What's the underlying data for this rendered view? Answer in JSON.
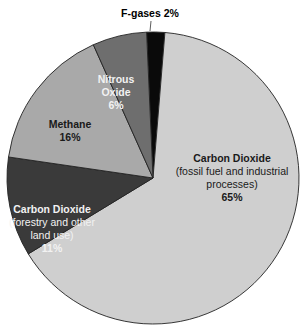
{
  "chart_data": {
    "type": "pie",
    "title": "",
    "slices": [
      {
        "name": "F-gases",
        "value": 2,
        "percent_label": "2%",
        "label_lines": [],
        "color": "#0a0a0a",
        "text_color": "#111111"
      },
      {
        "name": "Carbon Dioxide (fossil fuel and industrial processes)",
        "value": 65,
        "percent_label": "65%",
        "label_lines": [
          "Carbon Dioxide",
          "(fossil fuel and industrial",
          "processes)"
        ],
        "color": "#cfcfcf",
        "text_color": "#1a1a1a"
      },
      {
        "name": "Carbon Dioxide (forestry and other land use)",
        "value": 11,
        "percent_label": "11%",
        "label_lines": [
          "Carbon Dioxide",
          "(forestry and other",
          "land use)"
        ],
        "color": "#3a3a3a",
        "text_color": "#f2f2f2"
      },
      {
        "name": "Methane",
        "value": 16,
        "percent_label": "16%",
        "label_lines": [
          "Methane"
        ],
        "color": "#a9a9a9",
        "text_color": "#1a1a1a"
      },
      {
        "name": "Nitrous Oxide",
        "value": 6,
        "percent_label": "6%",
        "label_lines": [
          "Nitrous",
          "Oxide"
        ],
        "color": "#6e6e6e",
        "text_color": "#f2f2f2"
      }
    ],
    "external_label": "F-gases 2%",
    "start_direction": "top",
    "order": "clockwise starting from F-gases"
  }
}
